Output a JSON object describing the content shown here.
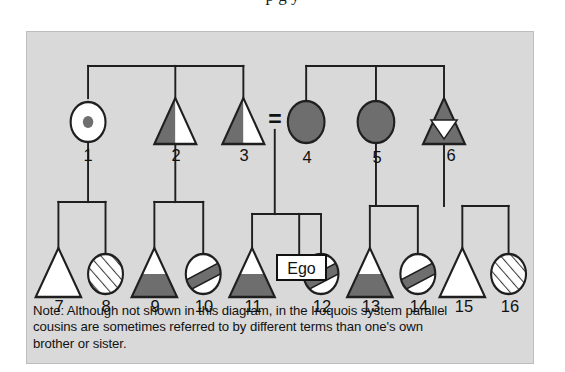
{
  "page": {
    "cut_off_title_sliver": "p   g  y",
    "background_color": "#ffffff",
    "panel_color": "#d9d9d9",
    "ink_color": "#111111",
    "fill_dark": "#6e6e6e",
    "fill_white": "#ffffff"
  },
  "figure": {
    "type": "kinship-diagram",
    "system": "Iroquois",
    "ego_label": "Ego",
    "marriage_symbol": "=",
    "note": "Note: Although not shown in this diagram, in the Iroquois system parallel cousins are sometimes referred to by different terms than one's own brother or sister.",
    "note_lines": [
      "Note: Although not shown in this diagram, in the Iroquois system parallel",
      "cousins are sometimes referred to by different terms than one's own",
      "brother or sister."
    ]
  },
  "generations": {
    "parent_row_label": "parental-generation",
    "child_row_label": "ego-generation"
  },
  "symbols": [
    {
      "id": 1,
      "label": "1",
      "shape": "circle",
      "fill": "circle-dot",
      "row": "parent",
      "cx": 70,
      "cy": 90
    },
    {
      "id": 2,
      "label": "2",
      "shape": "triangle",
      "fill": "left-half-dark",
      "row": "parent",
      "cx": 170,
      "cy": 90
    },
    {
      "id": 3,
      "label": "3",
      "shape": "triangle",
      "fill": "left-half-dark",
      "row": "parent",
      "cx": 248,
      "cy": 90
    },
    {
      "id": 4,
      "label": "4",
      "shape": "circle",
      "fill": "solid-dark",
      "row": "parent",
      "cx": 320,
      "cy": 90
    },
    {
      "id": 5,
      "label": "5",
      "shape": "circle",
      "fill": "solid-dark",
      "row": "parent",
      "cx": 400,
      "cy": 90
    },
    {
      "id": 6,
      "label": "6",
      "shape": "triangle",
      "fill": "dark-with-white-inverted-triangle",
      "row": "parent",
      "cx": 478,
      "cy": 90
    },
    {
      "id": 7,
      "label": "7",
      "shape": "triangle",
      "fill": "white",
      "row": "child",
      "cx": 36,
      "cy": 242
    },
    {
      "id": 8,
      "label": "8",
      "shape": "circle",
      "fill": "hatched",
      "row": "child",
      "cx": 90,
      "cy": 242
    },
    {
      "id": 9,
      "label": "9",
      "shape": "triangle",
      "fill": "bottom-half-dark",
      "row": "child",
      "cx": 146,
      "cy": 242
    },
    {
      "id": 10,
      "label": "10",
      "shape": "circle",
      "fill": "diagonal-band",
      "row": "child",
      "cx": 202,
      "cy": 242
    },
    {
      "id": 11,
      "label": "11",
      "shape": "triangle",
      "fill": "bottom-half-dark",
      "row": "child",
      "cx": 258,
      "cy": 242
    },
    {
      "id": 12,
      "label": "12",
      "shape": "circle",
      "fill": "diagonal-band",
      "row": "child",
      "cx": 337,
      "cy": 242
    },
    {
      "id": 13,
      "label": "13",
      "shape": "triangle",
      "fill": "bottom-half-dark",
      "row": "child",
      "cx": 393,
      "cy": 242
    },
    {
      "id": 14,
      "label": "14",
      "shape": "circle",
      "fill": "diagonal-band",
      "row": "child",
      "cx": 448,
      "cy": 242
    },
    {
      "id": 15,
      "label": "15",
      "shape": "triangle",
      "fill": "white",
      "row": "child",
      "cx": 499,
      "cy": 242
    },
    {
      "id": 16,
      "label": "16",
      "shape": "circle",
      "fill": "hatched",
      "row": "child",
      "cx": 552,
      "cy": 242
    }
  ],
  "ego": {
    "label": "Ego",
    "cx": 312,
    "cy": 242
  }
}
